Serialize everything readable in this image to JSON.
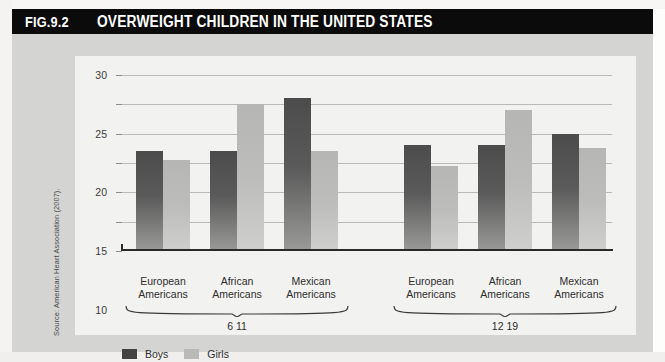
{
  "figure": {
    "number": "FIG.9.2",
    "title": "OVERWEIGHT CHILDREN IN THE UNITED STATES",
    "source_note": "Source: American Heart Association (2007)."
  },
  "legend": {
    "items": [
      {
        "label": "Boys",
        "color": "#434343"
      },
      {
        "label": "Girls",
        "color": "#b9b9b7"
      }
    ]
  },
  "axis": {
    "yticks": [
      "0",
      "5",
      "10",
      "15",
      "20",
      "25",
      "30"
    ]
  },
  "groups": [
    {
      "label": "6 11",
      "categories": [
        "European\nAmericans",
        "African\nAmericans",
        "Mexican\nAmericans"
      ]
    },
    {
      "label": "12 19",
      "categories": [
        "European\nAmericans",
        "African\nAmericans",
        "Mexican\nAmericans"
      ]
    }
  ],
  "chart_data": {
    "type": "bar",
    "title": "OVERWEIGHT CHILDREN IN THE UNITED STATES",
    "xlabel": "",
    "ylabel": "",
    "ylim": [
      0,
      30
    ],
    "ytick_step": 5,
    "grid": true,
    "legend_position": "bottom-left",
    "categories": [
      "European Americans 6 11",
      "African Americans 6 11",
      "Mexican Americans 6 11",
      "European Americans 12 19",
      "African Americans 12 19",
      "Mexican Americans 12 19"
    ],
    "series": [
      {
        "name": "Boys",
        "color": "#4c4c4c",
        "values": [
          17,
          17,
          26,
          18,
          18,
          20
        ]
      },
      {
        "name": "Girls",
        "color": "#b9b9b7",
        "values": [
          15.5,
          25,
          17,
          14.5,
          24,
          17.5
        ]
      }
    ],
    "age_groups": [
      "6 11",
      "12 19"
    ],
    "ethnicities": [
      "European Americans",
      "African Americans",
      "Mexican Americans"
    ],
    "source": "American Heart Association (2007)."
  }
}
